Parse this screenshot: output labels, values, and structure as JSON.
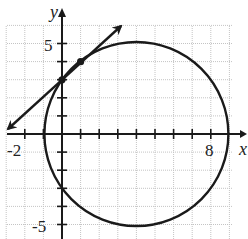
{
  "figure": {
    "axes": {
      "x_label": "x",
      "y_label": "y",
      "x_tick_labels": [
        "-2",
        "8"
      ],
      "y_tick_labels": [
        "5",
        "-5"
      ],
      "x_range": [
        -3,
        9
      ],
      "y_range": [
        -6,
        6
      ]
    },
    "circle": {
      "center": [
        4,
        0
      ],
      "radius": 5
    },
    "line": {
      "equation": "y = x + 3",
      "points": [
        [
          0,
          3
        ],
        [
          1,
          4
        ]
      ]
    },
    "colors": {
      "ink": "#1a1a1a",
      "grid": "#bdbdbd"
    }
  }
}
